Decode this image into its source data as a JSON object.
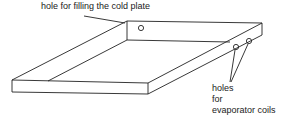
{
  "diagram": {
    "labels": {
      "fill_hole": "hole for filling the cold plate",
      "coil_holes_line1": "holes",
      "coil_holes_line2": "for",
      "coil_holes_line3": "evaporator coils"
    },
    "colors": {
      "line": "#222222",
      "background": "#ffffff"
    }
  }
}
